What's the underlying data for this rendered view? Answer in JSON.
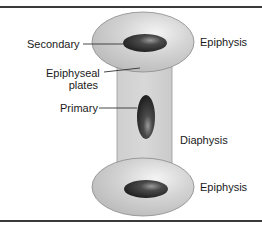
{
  "diagram": {
    "labels": {
      "secondary": "Secondary",
      "epiphyseal_plates_line1": "Epiphyseal",
      "epiphyseal_plates_line2": "plates",
      "primary": "Primary",
      "epiphysis_top": "Epiphysis",
      "diaphysis": "Diaphysis",
      "epiphysis_bottom": "Epiphysis"
    },
    "colors": {
      "epiphysis_fill": "#c9c9c9",
      "diaphysis_fill": "#d2d2d2",
      "ossification_center": "#2e2e2e",
      "outline": "#8a8a8a",
      "rule": "#3a3a3a"
    }
  }
}
